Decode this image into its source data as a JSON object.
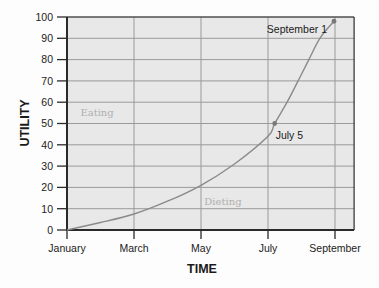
{
  "chart_data": {
    "type": "line",
    "title": "",
    "xlabel": "TIME",
    "ylabel": "UTILITY",
    "x_unit": "months after January",
    "xlim": [
      0,
      8.57
    ],
    "ylim": [
      0,
      100
    ],
    "grid": true,
    "legend": "none",
    "x_ticks": [
      {
        "label": "January",
        "x": 0
      },
      {
        "label": "March",
        "x": 2
      },
      {
        "label": "May",
        "x": 4
      },
      {
        "label": "July",
        "x": 6
      },
      {
        "label": "September",
        "x": 8
      }
    ],
    "y_ticks": [
      0,
      10,
      20,
      30,
      40,
      50,
      60,
      70,
      80,
      90,
      100
    ],
    "series": [
      {
        "name": "Utility",
        "x": [
          0,
          1,
          2,
          3,
          4,
          5,
          6,
          6.2,
          6.57,
          6.9,
          7.22,
          7.55,
          7.97
        ],
        "values": [
          0,
          3.5,
          7.5,
          13.5,
          21,
          31,
          44,
          50,
          60,
          70,
          80,
          90,
          98
        ]
      }
    ],
    "highlighted_points": [
      {
        "label": "July 5",
        "x": 6.2,
        "y": 50
      },
      {
        "label": "September 1",
        "x": 7.97,
        "y": 98
      }
    ],
    "region_labels": [
      {
        "text": "Eating",
        "x": 0.4,
        "y": 55
      },
      {
        "text": "Dieting",
        "x": 4.1,
        "y": 13
      }
    ]
  },
  "colors": {
    "plot_background": "#e8e8e8",
    "grid": "#9a9a9a",
    "axis": "#2a2a2a",
    "curve": "#8a8a8a",
    "point": "#7a7a7a"
  }
}
